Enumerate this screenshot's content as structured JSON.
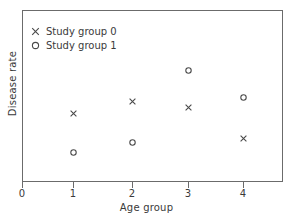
{
  "chart_data": {
    "type": "scatter",
    "title": "",
    "xlabel": "Age group",
    "ylabel": "Disease rate",
    "xticklabels": [
      "0",
      "1",
      "2",
      "3",
      "4"
    ],
    "xticks": [
      0,
      1,
      2,
      3,
      4
    ],
    "yticklabels": [],
    "xlim": [
      0,
      4.7
    ],
    "ylim": [
      0,
      1
    ],
    "grid": false,
    "legend_position": "upper left",
    "x": [
      1,
      2,
      3,
      4
    ],
    "series": [
      {
        "name": "Study group 0",
        "marker": "x",
        "color": "#4a4a4a",
        "x": [
          1,
          2,
          3,
          4
        ],
        "values": [
          0.4,
          0.47,
          0.44,
          0.26
        ]
      },
      {
        "name": "Study group 1",
        "marker": "o",
        "color": "#4a4a4a",
        "x": [
          1,
          2,
          3,
          4
        ],
        "values": [
          0.17,
          0.23,
          0.65,
          0.5
        ]
      }
    ]
  },
  "axes": {
    "x_title": "Age group",
    "y_title": "Disease rate",
    "x_ticks": [
      {
        "label": "0",
        "px": 22
      },
      {
        "label": "1",
        "px": 73
      },
      {
        "label": "2",
        "px": 132
      },
      {
        "label": "3",
        "px": 188
      },
      {
        "label": "4",
        "px": 243
      }
    ]
  },
  "legend": {
    "items": [
      {
        "label": "Study group 0",
        "marker": "cross-marker-icon"
      },
      {
        "label": "Study group 1",
        "marker": "circle-marker-icon"
      }
    ]
  },
  "points": [
    {
      "series": 0,
      "marker": "cross-marker-icon",
      "px": 73,
      "py": 113
    },
    {
      "series": 0,
      "marker": "cross-marker-icon",
      "px": 132,
      "py": 101
    },
    {
      "series": 0,
      "marker": "cross-marker-icon",
      "px": 188,
      "py": 107
    },
    {
      "series": 0,
      "marker": "cross-marker-icon",
      "px": 243,
      "py": 138
    },
    {
      "series": 1,
      "marker": "circle-marker-icon",
      "px": 73,
      "py": 152
    },
    {
      "series": 1,
      "marker": "circle-marker-icon",
      "px": 132,
      "py": 142
    },
    {
      "series": 1,
      "marker": "circle-marker-icon",
      "px": 188,
      "py": 70
    },
    {
      "series": 1,
      "marker": "circle-marker-icon",
      "px": 243,
      "py": 97
    }
  ],
  "colors": {
    "marker": "#4a4a4a",
    "frame": "#6b6b6b",
    "text": "#3a3a3a",
    "background": "#ffffff"
  }
}
